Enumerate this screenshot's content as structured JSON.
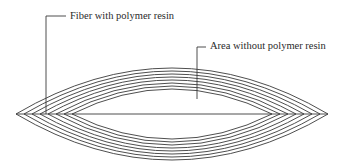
{
  "diagram": {
    "labels": {
      "fiber": "Fiber with polymer resin",
      "area": "Area without polymer resin"
    },
    "colors": {
      "line": "#3a3a3a",
      "text": "#2a2a2a",
      "background": "#ffffff"
    }
  }
}
